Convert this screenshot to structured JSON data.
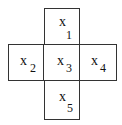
{
  "diagram": {
    "type": "cross-stencil",
    "cells": [
      {
        "id": "top",
        "var": "x",
        "sub": "1"
      },
      {
        "id": "left",
        "var": "x",
        "sub": "2"
      },
      {
        "id": "center",
        "var": "x",
        "sub": "3"
      },
      {
        "id": "right",
        "var": "x",
        "sub": "4"
      },
      {
        "id": "bottom",
        "var": "x",
        "sub": "5"
      }
    ]
  }
}
